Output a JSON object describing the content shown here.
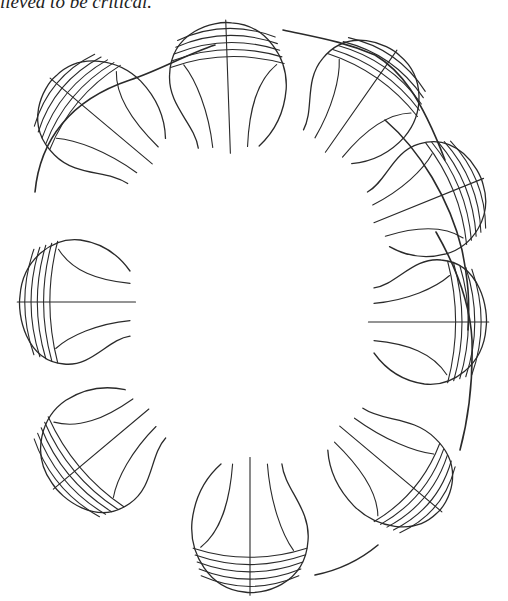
{
  "caption": {
    "text": "lieved to be critical."
  },
  "figure": {
    "stroke_color": "#2a2a2a",
    "background": "#ffffff",
    "center": [
      255,
      318
    ],
    "lobes": [
      {
        "id": "lobe-top-left",
        "cx": 100,
        "cy": 120,
        "angle": -140,
        "rx": 62,
        "ry": 56,
        "grid_lines": 5
      },
      {
        "id": "lobe-top",
        "cx": 228,
        "cy": 85,
        "angle": -92,
        "rx": 62,
        "ry": 58,
        "grid_lines": 5
      },
      {
        "id": "lobe-top-right",
        "cx": 362,
        "cy": 100,
        "angle": -55,
        "rx": 58,
        "ry": 56,
        "grid_lines": 5
      },
      {
        "id": "lobe-right-upper",
        "cx": 430,
        "cy": 200,
        "angle": -22,
        "rx": 55,
        "ry": 56,
        "grid_lines": 5
      },
      {
        "id": "lobe-right",
        "cx": 430,
        "cy": 322,
        "angle": 0,
        "rx": 56,
        "ry": 62,
        "grid_lines": 5
      },
      {
        "id": "lobe-bottom-right",
        "cx": 392,
        "cy": 470,
        "angle": 40,
        "rx": 62,
        "ry": 52,
        "grid_lines": 5
      },
      {
        "id": "lobe-bottom",
        "cx": 250,
        "cy": 528,
        "angle": 90,
        "rx": 64,
        "ry": 58,
        "grid_lines": 5
      },
      {
        "id": "lobe-bottom-left",
        "cx": 100,
        "cy": 450,
        "angle": 140,
        "rx": 58,
        "ry": 60,
        "grid_lines": 5
      },
      {
        "id": "lobe-left",
        "cx": 75,
        "cy": 302,
        "angle": 180,
        "rx": 55,
        "ry": 62,
        "grid_lines": 5
      }
    ]
  }
}
